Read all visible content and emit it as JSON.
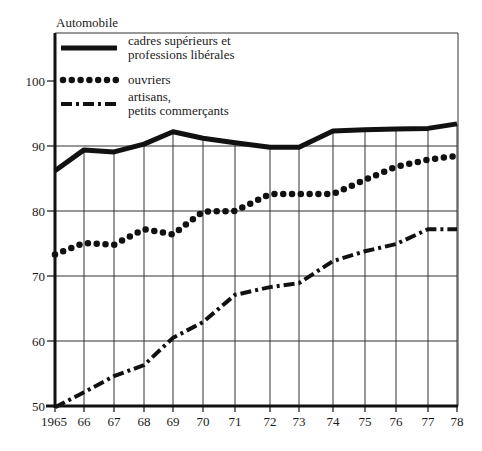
{
  "chart_data": {
    "type": "line",
    "title": "Automobile",
    "xlabel": "",
    "ylabel": "",
    "x": [
      1965,
      1966,
      1967,
      1968,
      1969,
      1970,
      1971,
      1972,
      1973,
      1974,
      1975,
      1976,
      1977,
      1978
    ],
    "x_tick_labels": [
      "1965",
      "66",
      "67",
      "68",
      "69",
      "70",
      "71",
      "72",
      "73",
      "74",
      "75",
      "76",
      "77",
      "78"
    ],
    "y_ticks": [
      50,
      60,
      70,
      80,
      90,
      100
    ],
    "ylim": [
      50,
      104
    ],
    "grid": true,
    "legend_position": "top-left inside",
    "series": [
      {
        "name": "cadres supérieurs et professions libérales",
        "legend_lines": [
          "cadres supérieurs et",
          "professions libérales"
        ],
        "style": "solid",
        "values": [
          86.2,
          89.4,
          89.1,
          90.3,
          92.2,
          91.2,
          90.5,
          89.8,
          89.8,
          92.3,
          92.5,
          92.6,
          92.7,
          93.4
        ]
      },
      {
        "name": "ouvriers",
        "legend_lines": [
          "ouvriers"
        ],
        "style": "dotted",
        "values": [
          73.3,
          75.1,
          74.8,
          77.2,
          76.4,
          79.9,
          80.0,
          82.6,
          82.6,
          82.6,
          84.8,
          86.8,
          87.9,
          88.5
        ]
      },
      {
        "name": "artisans, petits commerçants",
        "legend_lines": [
          "artisans,",
          "petits commerçants"
        ],
        "style": "dash-dot",
        "values": [
          49.8,
          52.1,
          54.6,
          56.3,
          60.5,
          62.9,
          67.1,
          68.3,
          68.9,
          72.3,
          73.8,
          74.9,
          77.2,
          77.2
        ]
      }
    ]
  },
  "colors": {
    "ink": "#111111",
    "grid": "#333333",
    "background": "#ffffff"
  },
  "layout": {
    "x_pixel": [
      55,
      84,
      114,
      144,
      173,
      203,
      235,
      270,
      299,
      333,
      365,
      396,
      428,
      457
    ],
    "y_of_50": 406,
    "px_per_unit": 6.5,
    "frame_top": 33,
    "frame_right": 458
  }
}
